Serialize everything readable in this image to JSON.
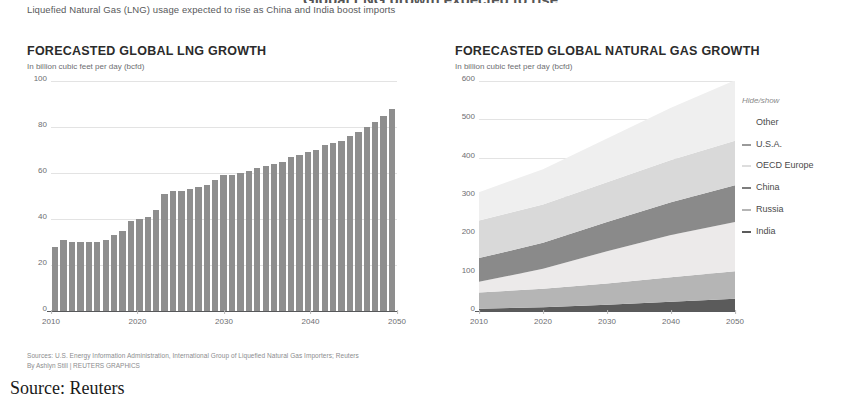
{
  "clipped_title": "Global LNG growth expected to rise",
  "deck": "Liquefied Natural Gas (LNG) usage expected to rise as China and India boost imports",
  "left_panel": {
    "title": "FORECASTED GLOBAL LNG GROWTH",
    "subtitle": "In billion cubic feet per day (bcfd)"
  },
  "right_panel": {
    "title": "FORECASTED GLOBAL NATURAL GAS GROWTH",
    "subtitle": "In billion cubic feet per day (bcfd)",
    "hide_show_label": "Hide/show"
  },
  "legend": {
    "items": [
      {
        "label": "Other",
        "color": "#eeeeee",
        "dash": false
      },
      {
        "label": "U.S.A.",
        "color": "#9a9a9a",
        "dash": true
      },
      {
        "label": "OECD Europe",
        "color": "#dddddd",
        "dash": true
      },
      {
        "label": "China",
        "color": "#7d7d7d",
        "dash": true
      },
      {
        "label": "Russia",
        "color": "#b5b5b5",
        "dash": true
      },
      {
        "label": "India",
        "color": "#5b5b5b",
        "dash": true
      }
    ]
  },
  "footer": {
    "sources": "Sources: U.S. Energy Information Administration, International Group of Liquefied Natural Gas Importers; Reuters",
    "byline": "By Ashlyn Still | REUTERS GRAPHICS"
  },
  "caption": "Source: Reuters",
  "colors": {
    "bar": "#8e8e8e",
    "grid": "#e3e3e3",
    "axis": "#58595b",
    "text": "#6d6e71"
  },
  "chart_data": [
    {
      "type": "bar",
      "id": "lng-growth",
      "title": "FORECASTED GLOBAL LNG GROWTH",
      "subtitle": "In billion cubic feet per day (bcfd)",
      "xlabel": "",
      "ylabel": "billion cubic feet per day (bcfd)",
      "ylim": [
        0,
        100
      ],
      "yticks": [
        0,
        20,
        40,
        60,
        80,
        100
      ],
      "xticks": [
        2010,
        2020,
        2030,
        2040,
        2050
      ],
      "grid": true,
      "legend_position": "none",
      "series_color": "#8e8e8e",
      "categories": [
        2010,
        2011,
        2012,
        2013,
        2014,
        2015,
        2016,
        2017,
        2018,
        2019,
        2020,
        2021,
        2022,
        2023,
        2024,
        2025,
        2026,
        2027,
        2028,
        2029,
        2030,
        2031,
        2032,
        2033,
        2034,
        2035,
        2036,
        2037,
        2038,
        2039,
        2040,
        2041,
        2042,
        2043,
        2044,
        2045,
        2046,
        2047,
        2048,
        2049,
        2050
      ],
      "values": [
        28,
        31,
        30,
        30,
        30,
        30,
        31,
        33,
        35,
        39,
        40,
        41,
        44,
        51,
        52,
        52,
        53,
        54,
        55,
        57,
        59,
        59,
        60,
        61,
        62,
        63,
        64,
        65,
        67,
        68,
        69,
        70,
        72,
        73,
        74,
        76,
        78,
        80,
        82,
        85,
        88
      ]
    },
    {
      "type": "area",
      "id": "natural-gas-growth",
      "stacked": true,
      "title": "FORECASTED GLOBAL NATURAL GAS GROWTH",
      "subtitle": "In billion cubic feet per day (bcfd)",
      "xlabel": "",
      "ylabel": "billion cubic feet per day (bcfd)",
      "ylim": [
        0,
        600
      ],
      "yticks": [
        0,
        100,
        200,
        300,
        400,
        500,
        600
      ],
      "xticks": [
        2010,
        2020,
        2030,
        2040,
        2050
      ],
      "x": [
        2010,
        2020,
        2030,
        2040,
        2050
      ],
      "grid": true,
      "legend_position": "right",
      "series": [
        {
          "name": "India",
          "color": "#5b5b5b",
          "values": [
            6,
            10,
            16,
            24,
            32
          ]
        },
        {
          "name": "Russia",
          "color": "#b5b5b5",
          "values": [
            42,
            48,
            56,
            64,
            72
          ]
        },
        {
          "name": "China",
          "color": "#eceaea",
          "values": [
            28,
            52,
            84,
            110,
            128
          ]
        },
        {
          "name": "U.S.A.",
          "color": "#8a8a8a",
          "values": [
            62,
            68,
            76,
            86,
            96
          ]
        },
        {
          "name": "OECD Europe",
          "color": "#d9d9d9",
          "values": [
            98,
            100,
            104,
            110,
            116
          ]
        },
        {
          "name": "Other",
          "color": "#efefef",
          "values": [
            74,
            92,
            114,
            136,
            158
          ]
        }
      ]
    }
  ]
}
